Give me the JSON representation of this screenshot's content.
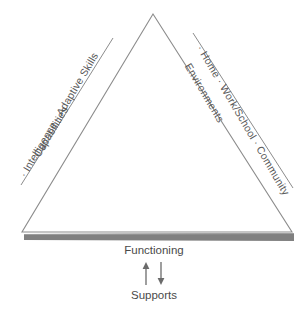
{
  "diagram": {
    "background_color": "#ffffff",
    "line_color": "#8c8c8c",
    "base_bar_color": "#808080",
    "text_color": "#595959",
    "left_side": {
      "heading": "Capabilities",
      "items_label": "· Intelligence · Adaptive Skills",
      "items": [
        "Intelligence",
        "Adaptive Skills"
      ]
    },
    "right_side": {
      "heading": "Environments",
      "items_label": "· Home · Work/School · Community",
      "items": [
        "Home",
        "Work/School",
        "Community"
      ]
    },
    "bottom": {
      "top_label": "Functioning",
      "bottom_label": "Supports",
      "up_arrow": "arrow-up-icon",
      "down_arrow": "arrow-down-icon"
    },
    "geometry": {
      "apex": [
        153,
        14
      ],
      "bottom_left": [
        22,
        232
      ],
      "bottom_right": [
        292,
        232
      ],
      "left_outer_line": [
        [
          113,
          38
        ],
        [
          21,
          185
        ]
      ],
      "right_outer_line": [
        [
          193,
          33
        ],
        [
          293,
          188
        ]
      ]
    }
  }
}
